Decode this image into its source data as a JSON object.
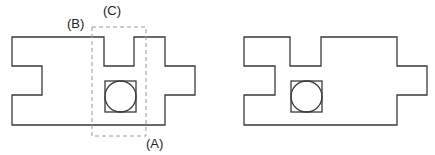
{
  "labels": {
    "a": "(A)",
    "b": "(B)",
    "c": "(C)"
  },
  "figures": [
    {
      "name": "left-part",
      "outline_points": "12,37 104,37 104,66 134,66 134,37 165,37 165,66 195,66 195,95 165,95 165,125 12,125 12,95 42,95 42,66 12,66",
      "square": {
        "x": 105,
        "y": 81,
        "w": 31,
        "h": 31
      },
      "circle": {
        "cx": 120.5,
        "cy": 96.5,
        "r": 15.5
      },
      "selection_box": {
        "x": 92,
        "y": 27,
        "w": 54,
        "h": 109
      }
    },
    {
      "name": "right-part",
      "outline_points": "244,37 290,37 290,66 321,66 321,37 397,37 397,66 427,66 427,95 397,95 397,125 244,125 244,95 275,95 275,66 244,66",
      "square": {
        "x": 291,
        "y": 81,
        "w": 31,
        "h": 31
      },
      "circle": {
        "cx": 306.5,
        "cy": 96.5,
        "r": 15.5
      }
    }
  ],
  "colors": {
    "outline": "#3a3a3a",
    "dashed": "#9a9a9a"
  }
}
